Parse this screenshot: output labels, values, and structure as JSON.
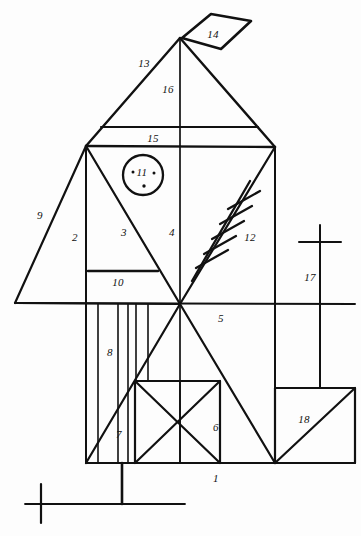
{
  "document": {
    "title": "Hand-drawn House-Tree-Person style line sketch",
    "medium": "black ink line drawing on white paper",
    "width": 361,
    "height": 536,
    "ink_color": "#111111",
    "paper_color": "#fdfdfd"
  },
  "labels": [
    {
      "id": "l1",
      "text": "1",
      "x": 216,
      "y": 478
    },
    {
      "id": "l2",
      "text": "2",
      "x": 75,
      "y": 237
    },
    {
      "id": "l3",
      "text": "3",
      "x": 124,
      "y": 232
    },
    {
      "id": "l4",
      "text": "4",
      "x": 172,
      "y": 232
    },
    {
      "id": "l5",
      "text": "5",
      "x": 221,
      "y": 318
    },
    {
      "id": "l6",
      "text": "6",
      "x": 216,
      "y": 427
    },
    {
      "id": "l7",
      "text": "7",
      "x": 119,
      "y": 434
    },
    {
      "id": "l8",
      "text": "8",
      "x": 110,
      "y": 352
    },
    {
      "id": "l9",
      "text": "9",
      "x": 40,
      "y": 215
    },
    {
      "id": "l10",
      "text": "10",
      "x": 118,
      "y": 282
    },
    {
      "id": "l11",
      "text": "11",
      "x": 142,
      "y": 172
    },
    {
      "id": "l12",
      "text": "12",
      "x": 250,
      "y": 237
    },
    {
      "id": "l13",
      "text": "13",
      "x": 144,
      "y": 63
    },
    {
      "id": "l14",
      "text": "14",
      "x": 213,
      "y": 34
    },
    {
      "id": "l15",
      "text": "15",
      "x": 153,
      "y": 138
    },
    {
      "id": "l16",
      "text": "16",
      "x": 168,
      "y": 89
    },
    {
      "id": "l17",
      "text": "17",
      "x": 310,
      "y": 277
    },
    {
      "id": "l18",
      "text": "18",
      "x": 304,
      "y": 419
    }
  ],
  "strokes": {
    "roof": {
      "apex": [
        180,
        38
      ],
      "left_eave": [
        86,
        146
      ],
      "right_eave": [
        275,
        147
      ],
      "collar_tie_y": 118,
      "plate_y": 146
    },
    "body": {
      "left_wall_x": 86,
      "right_wall_x": 275,
      "center_x": 180,
      "mid_y": 304,
      "base_y": 463
    },
    "flag": {
      "points": "182,38 212,15 250,22 219,49"
    },
    "ladder": {
      "rungs": 5,
      "from": [
        196,
        272
      ],
      "to": [
        246,
        186
      ]
    },
    "circle": {
      "cx": 143,
      "cy": 175,
      "r": 20
    },
    "ground": {
      "y": 504,
      "x1": 25,
      "x2": 185
    },
    "cross_left": {
      "x": 40,
      "y": 504
    },
    "cross_right": {
      "x": 320,
      "y": 242
    }
  }
}
